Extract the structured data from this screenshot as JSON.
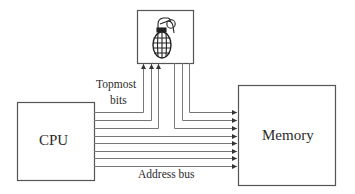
{
  "diagram": {
    "colors": {
      "stroke": "#555555",
      "text": "#2a2a2a",
      "background": "#ffffff"
    },
    "cpu": {
      "label": "CPU",
      "x": 17,
      "y": 102,
      "w": 77,
      "h": 78
    },
    "memory": {
      "label": "Memory",
      "x": 238,
      "y": 85,
      "w": 97,
      "h": 100
    },
    "bomb_box": {
      "icon": "grenade-icon",
      "x": 137,
      "y": 10,
      "w": 56,
      "h": 53
    },
    "labels": {
      "topmost_line1": "Topmost",
      "topmost_line2": "bits",
      "address_bus": "Address bus"
    },
    "bus": {
      "line_count": 8,
      "line_ys": [
        112,
        120,
        128,
        136,
        143,
        151,
        158,
        166
      ],
      "up_lines_x": [
        143,
        151,
        158
      ],
      "down_lines_x": [
        189,
        182,
        174
      ]
    }
  }
}
